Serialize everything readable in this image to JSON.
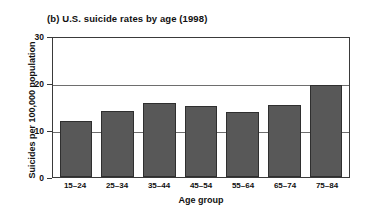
{
  "chart_data": {
    "type": "bar",
    "title": "(b) U.S. suicide rates by age (1998)",
    "xlabel": "Age group",
    "ylabel": "Suicides per 100,000 population",
    "categories": [
      "15–24",
      "25–34",
      "35–44",
      "45–54",
      "55–64",
      "65–74",
      "75–84"
    ],
    "values": [
      11.9,
      14.1,
      15.7,
      15.1,
      13.9,
      15.3,
      19.6
    ],
    "ylim": [
      0,
      30
    ],
    "yticks": [
      0,
      10,
      20,
      30
    ],
    "ytick_labels": [
      "0",
      "10",
      "20",
      "30"
    ],
    "grid": "horizontal",
    "gridlines_at": [
      10,
      20
    ],
    "legend": "none",
    "bar_color": "#585858",
    "bar_edge_color": "#2f2f2f",
    "axis_color": "#3a3a3a",
    "grid_color": "#6e6e6e",
    "background": "#ffffff"
  }
}
